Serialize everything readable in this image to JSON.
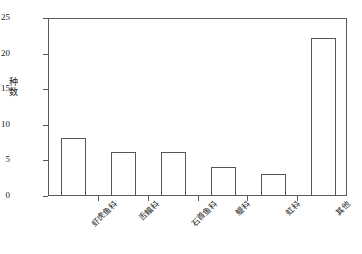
{
  "chart_data": {
    "type": "bar",
    "title": "",
    "subtitle": "",
    "xlabel": "",
    "ylabel": "种数",
    "ylim": [
      0,
      25
    ],
    "ytick_values": [
      0,
      5,
      10,
      15,
      20,
      25
    ],
    "ytick_labels": [
      "0",
      "5",
      "10",
      "15",
      "20",
      "25"
    ],
    "grid": false,
    "legend": false,
    "legend_position": "none",
    "categories": [
      "虾虎鱼科",
      "舌鳎科",
      "石首鱼科",
      "鳀科",
      "虹科",
      "其他"
    ],
    "values": [
      8,
      6,
      6,
      4,
      3,
      22
    ],
    "bar_facecolor": "#ffffff",
    "bar_edgecolor": "#555555",
    "axis_color": "#5a5a5a",
    "text_color": "#1a1a1a",
    "background": "#ffffff",
    "annotations": []
  },
  "axis": {
    "y_label_chars": [
      "种",
      "数"
    ]
  }
}
